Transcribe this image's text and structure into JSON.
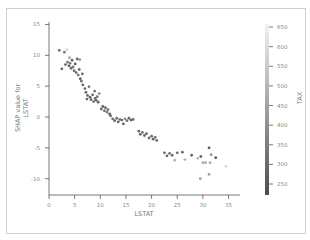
{
  "chart_data": {
    "type": "scatter",
    "title": "",
    "xlabel": "LSTAT",
    "ylabel_lines": [
      "SHAP value for",
      "LSTAT"
    ],
    "xlim": [
      0,
      37
    ],
    "ylim": [
      -12.5,
      15.5
    ],
    "xticks": [
      0,
      5,
      10,
      15,
      20,
      25,
      30,
      35
    ],
    "yticks": [
      15,
      10,
      5,
      0,
      -5,
      -10
    ],
    "colorbar": {
      "label": "TAX",
      "ticks": [
        650,
        600,
        550,
        500,
        450,
        400,
        350,
        300,
        250
      ],
      "range": [
        220,
        670
      ],
      "color_low": "#4d4d4d",
      "color_high": "#f2f2f2"
    },
    "grid": false,
    "points": [
      {
        "x": 2.0,
        "y": 10.8,
        "c": 300
      },
      {
        "x": 3.0,
        "y": 10.5,
        "c": 350
      },
      {
        "x": 3.5,
        "y": 10.9,
        "c": 600
      },
      {
        "x": 2.5,
        "y": 7.8,
        "c": 280
      },
      {
        "x": 3.2,
        "y": 8.5,
        "c": 300
      },
      {
        "x": 3.6,
        "y": 8.9,
        "c": 320
      },
      {
        "x": 3.9,
        "y": 8.3,
        "c": 260
      },
      {
        "x": 4.1,
        "y": 8.7,
        "c": 330
      },
      {
        "x": 4.3,
        "y": 7.9,
        "c": 300
      },
      {
        "x": 4.5,
        "y": 9.2,
        "c": 280
      },
      {
        "x": 4.7,
        "y": 8.1,
        "c": 340
      },
      {
        "x": 4.9,
        "y": 7.5,
        "c": 300
      },
      {
        "x": 5.1,
        "y": 8.6,
        "c": 270
      },
      {
        "x": 5.3,
        "y": 7.2,
        "c": 310
      },
      {
        "x": 5.5,
        "y": 9.4,
        "c": 290
      },
      {
        "x": 5.7,
        "y": 6.8,
        "c": 330
      },
      {
        "x": 5.9,
        "y": 7.7,
        "c": 300
      },
      {
        "x": 6.1,
        "y": 6.2,
        "c": 280
      },
      {
        "x": 6.3,
        "y": 5.8,
        "c": 320
      },
      {
        "x": 6.5,
        "y": 7.0,
        "c": 300
      },
      {
        "x": 4.0,
        "y": 9.6,
        "c": 450
      },
      {
        "x": 6.0,
        "y": 9.3,
        "c": 400
      },
      {
        "x": 6.6,
        "y": 5.2,
        "c": 290
      },
      {
        "x": 7.0,
        "y": 4.6,
        "c": 300
      },
      {
        "x": 7.2,
        "y": 4.0,
        "c": 280
      },
      {
        "x": 7.5,
        "y": 3.5,
        "c": 310
      },
      {
        "x": 7.8,
        "y": 4.9,
        "c": 350
      },
      {
        "x": 8.0,
        "y": 3.2,
        "c": 270
      },
      {
        "x": 8.2,
        "y": 2.8,
        "c": 300
      },
      {
        "x": 8.5,
        "y": 3.6,
        "c": 290
      },
      {
        "x": 8.7,
        "y": 2.5,
        "c": 320
      },
      {
        "x": 9.0,
        "y": 3.0,
        "c": 280
      },
      {
        "x": 9.2,
        "y": 2.7,
        "c": 300
      },
      {
        "x": 9.4,
        "y": 3.3,
        "c": 330
      },
      {
        "x": 9.6,
        "y": 2.4,
        "c": 290
      },
      {
        "x": 9.8,
        "y": 3.8,
        "c": 400
      },
      {
        "x": 8.9,
        "y": 4.2,
        "c": 310
      },
      {
        "x": 7.4,
        "y": 2.9,
        "c": 300
      },
      {
        "x": 10.2,
        "y": 1.3,
        "c": 300
      },
      {
        "x": 10.5,
        "y": 1.7,
        "c": 280
      },
      {
        "x": 10.8,
        "y": 1.0,
        "c": 310
      },
      {
        "x": 11.0,
        "y": 1.5,
        "c": 290
      },
      {
        "x": 11.3,
        "y": 0.8,
        "c": 320
      },
      {
        "x": 11.5,
        "y": 1.2,
        "c": 300
      },
      {
        "x": 11.8,
        "y": 0.5,
        "c": 270
      },
      {
        "x": 12.0,
        "y": 0.2,
        "c": 300
      },
      {
        "x": 12.4,
        "y": -0.3,
        "c": 300
      },
      {
        "x": 12.8,
        "y": -0.6,
        "c": 280
      },
      {
        "x": 13.2,
        "y": -0.2,
        "c": 310
      },
      {
        "x": 13.5,
        "y": -0.8,
        "c": 290
      },
      {
        "x": 13.8,
        "y": -0.4,
        "c": 330
      },
      {
        "x": 14.2,
        "y": -0.5,
        "c": 300
      },
      {
        "x": 14.5,
        "y": -1.1,
        "c": 270
      },
      {
        "x": 14.8,
        "y": -0.3,
        "c": 400
      },
      {
        "x": 15.2,
        "y": -0.6,
        "c": 320
      },
      {
        "x": 15.6,
        "y": -0.2,
        "c": 300
      },
      {
        "x": 16.0,
        "y": -0.5,
        "c": 290
      },
      {
        "x": 16.4,
        "y": -0.4,
        "c": 310
      },
      {
        "x": 17.5,
        "y": -2.3,
        "c": 300
      },
      {
        "x": 17.8,
        "y": -2.8,
        "c": 280
      },
      {
        "x": 18.2,
        "y": -2.5,
        "c": 320
      },
      {
        "x": 18.6,
        "y": -3.0,
        "c": 300
      },
      {
        "x": 19.0,
        "y": -2.7,
        "c": 290
      },
      {
        "x": 19.5,
        "y": -3.4,
        "c": 310
      },
      {
        "x": 20.0,
        "y": -3.1,
        "c": 300
      },
      {
        "x": 20.3,
        "y": -3.6,
        "c": 280
      },
      {
        "x": 20.7,
        "y": -3.3,
        "c": 320
      },
      {
        "x": 21.0,
        "y": -3.8,
        "c": 300
      },
      {
        "x": 22.5,
        "y": -5.8,
        "c": 300
      },
      {
        "x": 23.0,
        "y": -6.3,
        "c": 280
      },
      {
        "x": 23.5,
        "y": -5.9,
        "c": 320
      },
      {
        "x": 24.0,
        "y": -6.2,
        "c": 310
      },
      {
        "x": 24.5,
        "y": -7.0,
        "c": 500
      },
      {
        "x": 25.0,
        "y": -5.8,
        "c": 300
      },
      {
        "x": 26.0,
        "y": -5.7,
        "c": 300
      },
      {
        "x": 26.5,
        "y": -6.9,
        "c": 500
      },
      {
        "x": 27.8,
        "y": -6.2,
        "c": 300
      },
      {
        "x": 29.0,
        "y": -6.7,
        "c": 520
      },
      {
        "x": 29.6,
        "y": -6.4,
        "c": 300
      },
      {
        "x": 30.0,
        "y": -7.4,
        "c": 480
      },
      {
        "x": 30.5,
        "y": -7.4,
        "c": 480
      },
      {
        "x": 31.2,
        "y": -5.0,
        "c": 250
      },
      {
        "x": 31.4,
        "y": -7.4,
        "c": 480
      },
      {
        "x": 31.6,
        "y": -6.1,
        "c": 420
      },
      {
        "x": 32.5,
        "y": -6.6,
        "c": 260
      },
      {
        "x": 29.5,
        "y": -10.0,
        "c": 450
      },
      {
        "x": 31.2,
        "y": -9.3,
        "c": 450
      },
      {
        "x": 34.5,
        "y": -8.0,
        "c": 600
      }
    ]
  }
}
